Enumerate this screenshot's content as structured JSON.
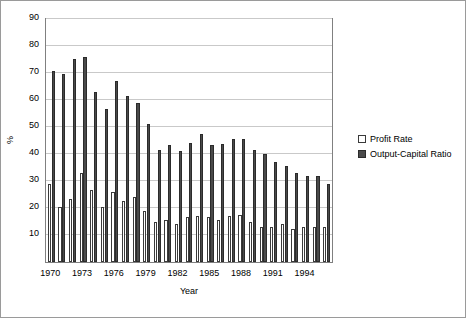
{
  "chart_data": {
    "type": "bar",
    "title": "",
    "xlabel": "Year",
    "ylabel": "%",
    "ylim": [
      0,
      90
    ],
    "ytick_step": 10,
    "yticks": [
      90,
      80,
      70,
      60,
      50,
      40,
      30,
      20,
      10
    ],
    "grid": true,
    "legend_position": "right",
    "categories": [
      "1970",
      "1971",
      "1972",
      "1973",
      "1974",
      "1975",
      "1976",
      "1977",
      "1978",
      "1979",
      "1980",
      "1981",
      "1982",
      "1983",
      "1984",
      "1985",
      "1986",
      "1987",
      "1988",
      "1989",
      "1990",
      "1991",
      "1992",
      "1993",
      "1994",
      "1995",
      "1996"
    ],
    "xtick_labels": [
      "1970",
      "1973",
      "1976",
      "1979",
      "1982",
      "1985",
      "1988",
      "1991",
      "1994"
    ],
    "xtick_categories": [
      "1970",
      "1973",
      "1976",
      "1979",
      "1982",
      "1985",
      "1988",
      "1991",
      "1994"
    ],
    "series": [
      {
        "name": "Profit Rate",
        "color": "#ffffff",
        "values": [
          28.8,
          20.5,
          23.2,
          33.0,
          26.5,
          20.3,
          25.8,
          22.5,
          24.0,
          19.0,
          15.0,
          15.5,
          14.0,
          16.5,
          17.0,
          16.5,
          15.5,
          17.0,
          17.5,
          15.0,
          13.0,
          12.8,
          14.0,
          12.3,
          13.0,
          13.0,
          13.0
        ]
      },
      {
        "name": "Output-Capital Ratio",
        "color": "#4a4a4a",
        "values": [
          70.8,
          69.5,
          75.2,
          76.0,
          63.0,
          56.5,
          67.0,
          61.5,
          58.8,
          51.2,
          41.5,
          43.5,
          41.0,
          44.0,
          47.5,
          43.5,
          43.8,
          45.5,
          45.5,
          41.5,
          40.0,
          37.0,
          35.5,
          33.0,
          32.0,
          31.8,
          28.8
        ]
      }
    ]
  },
  "legend": {
    "items": [
      {
        "label": "Profit Rate"
      },
      {
        "label": "Output-Capital Ratio"
      }
    ]
  }
}
